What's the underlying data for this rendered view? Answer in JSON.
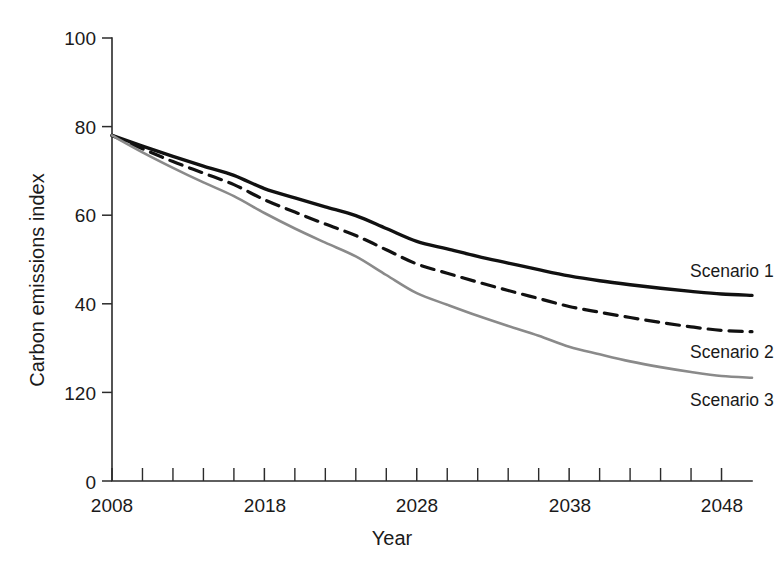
{
  "chart_data": {
    "type": "line",
    "title": "",
    "xlabel": "Year",
    "ylabel": "Carbon emissions index",
    "xlim": [
      2008,
      2050
    ],
    "ylim": [
      0,
      100
    ],
    "grid": false,
    "legend_position": "inline-right",
    "background_color": "#ffffff",
    "axis_color": "#2b2b2b",
    "x_tick_labels": [
      "2008",
      "2018",
      "2028",
      "2038",
      "2048"
    ],
    "x_tick_values": [
      2008,
      2018,
      2028,
      2038,
      2048
    ],
    "x_minor_tick_values": [
      2010,
      2012,
      2014,
      2016,
      2020,
      2022,
      2024,
      2026,
      2030,
      2032,
      2034,
      2036,
      2040,
      2042,
      2044,
      2046
    ],
    "y_tick_labels": [
      "100",
      "80",
      "60",
      "40",
      "120",
      "0"
    ],
    "y_tick_values": [
      100,
      80,
      60,
      40,
      20,
      0
    ],
    "x": [
      2008,
      2010,
      2012,
      2014,
      2016,
      2018,
      2020,
      2022,
      2024,
      2026,
      2028,
      2030,
      2032,
      2034,
      2036,
      2038,
      2040,
      2042,
      2044,
      2046,
      2048,
      2050
    ],
    "series": [
      {
        "name": "Scenario 1",
        "label": "Scenario 1",
        "color": "#111111",
        "style": "solid",
        "width": 3.4,
        "values": [
          78.0,
          75.6,
          73.3,
          71.1,
          69.0,
          66.0,
          63.9,
          61.9,
          59.9,
          57.0,
          54.1,
          52.4,
          50.7,
          49.2,
          47.7,
          46.3,
          45.2,
          44.3,
          43.5,
          42.8,
          42.2,
          41.9
        ]
      },
      {
        "name": "Scenario 2",
        "label": "Scenario 2",
        "color": "#111111",
        "style": "dashed",
        "width": 3.2,
        "values": [
          78.0,
          75.0,
          72.1,
          69.5,
          66.9,
          63.5,
          60.7,
          58.0,
          55.4,
          52.2,
          49.0,
          46.9,
          44.9,
          43.0,
          41.2,
          39.4,
          38.1,
          36.9,
          35.8,
          34.8,
          34.0,
          33.7
        ]
      },
      {
        "name": "Scenario 3",
        "label": "Scenario 3",
        "color": "#8a8a8a",
        "style": "solid",
        "width": 2.6,
        "values": [
          78.0,
          74.2,
          70.7,
          67.4,
          64.3,
          60.5,
          57.0,
          53.8,
          50.7,
          46.5,
          42.4,
          39.8,
          37.3,
          35.0,
          32.8,
          30.3,
          28.6,
          27.0,
          25.7,
          24.6,
          23.7,
          23.3
        ]
      }
    ]
  },
  "labels": {
    "scenario_1": "Scenario 1",
    "scenario_2": "Scenario 2",
    "scenario_3": "Scenario 3",
    "x_axis_title": "Year",
    "y_axis_title": "Carbon emissions index",
    "y_100": "100",
    "y_80": "80",
    "y_60": "60",
    "y_40": "40",
    "y_20": "120",
    "y_0": "0",
    "x_2008": "2008",
    "x_2018": "2018",
    "x_2028": "2028",
    "x_2038": "2038",
    "x_2048": "2048"
  }
}
